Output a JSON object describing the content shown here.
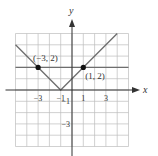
{
  "chart_data": {
    "type": "line",
    "title": "",
    "xlabel": "x",
    "ylabel": "y",
    "xlim": [
      -5,
      5
    ],
    "ylim": [
      -5,
      5
    ],
    "grid": true,
    "x_ticks": [
      {
        "value": -3,
        "label": "−3"
      },
      {
        "value": -1,
        "label": "−1"
      },
      {
        "value": 1,
        "label": "1"
      },
      {
        "value": 3,
        "label": "3"
      }
    ],
    "y_ticks": [
      {
        "value": -1,
        "label": "−1"
      },
      {
        "value": -3,
        "label": "−3"
      }
    ],
    "series": [
      {
        "name": "y = |x + 1|",
        "kind": "abs",
        "points": [
          [
            -5,
            4
          ],
          [
            -1,
            0
          ],
          [
            4,
            5
          ]
        ]
      },
      {
        "name": "y = 2",
        "kind": "horizontal",
        "points": [
          [
            -5,
            2
          ],
          [
            5,
            2
          ]
        ]
      }
    ],
    "marked_points": [
      {
        "x": -3,
        "y": 2,
        "label": "(−3, 2)",
        "label_pos": "above"
      },
      {
        "x": 1,
        "y": 2,
        "label": "(1, 2)",
        "label_pos": "below-right"
      }
    ],
    "colors": {
      "curve": "#6e6e6e",
      "grid": "#bdbdbd",
      "axis": "#333333",
      "point": "#111111"
    }
  }
}
